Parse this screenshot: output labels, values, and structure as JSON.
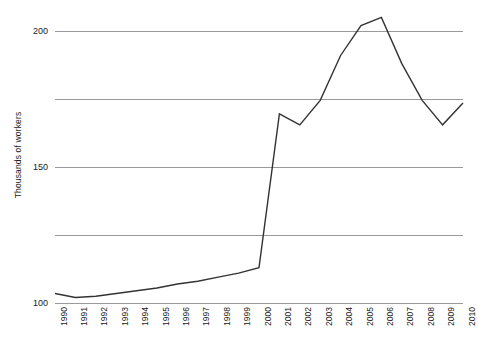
{
  "chart_data": {
    "type": "line",
    "title": "",
    "subtitle": "",
    "xlabel": "",
    "ylabel": "Thousands of workers",
    "categories": [
      "1990",
      "1991",
      "1992",
      "1993",
      "1994",
      "1995",
      "1996",
      "1997",
      "1998",
      "1999",
      "2000",
      "2001",
      "2002",
      "2003",
      "2004",
      "2005",
      "2006",
      "2007",
      "2008",
      "2009",
      "2010"
    ],
    "values": [
      7,
      4,
      5,
      7,
      9,
      11,
      14,
      16,
      19,
      22,
      26,
      139,
      131,
      149,
      182,
      204,
      210,
      176,
      149,
      131,
      147
    ],
    "series": [
      {
        "name": "Thousands of workers",
        "values": [
          7,
          4,
          5,
          7,
          9,
          11,
          14,
          16,
          19,
          22,
          26,
          139,
          131,
          149,
          182,
          204,
          210,
          176,
          149,
          131,
          147
        ]
      }
    ],
    "ylim": [
      0,
      210
    ],
    "yticks": [
      0,
      50,
      100,
      150,
      200
    ],
    "ytick_labels": [
      "0",
      "50",
      "100",
      "150",
      "200"
    ],
    "xlim": [
      "1990",
      "2010"
    ],
    "grid": "horizontal",
    "grid_color": "#9a9a9a",
    "line_color": "#333333",
    "line_width": 1.4,
    "legend": "none",
    "markers": "none",
    "background_color": "#ffffff",
    "annotations": []
  }
}
